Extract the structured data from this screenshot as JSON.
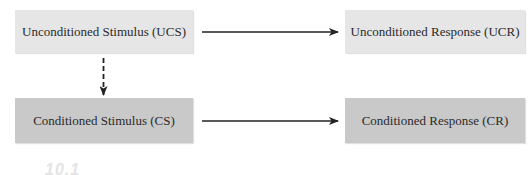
{
  "diagram": {
    "nodes": {
      "ucs": {
        "label": "Unconditioned Stimulus (UCS)",
        "fill": "#e6e6e6"
      },
      "ucr": {
        "label": "Unconditioned Response (UCR)",
        "fill": "#e6e6e6"
      },
      "cs": {
        "label": "Conditioned Stimulus (CS)",
        "fill": "#c9c9c9"
      },
      "cr": {
        "label": "Conditioned Response (CR)",
        "fill": "#c9c9c9"
      }
    },
    "edges": [
      {
        "from": "ucs",
        "to": "ucr",
        "style": "solid"
      },
      {
        "from": "ucs",
        "to": "cs",
        "style": "dashed"
      },
      {
        "from": "cs",
        "to": "cr",
        "style": "solid"
      }
    ],
    "caption_fragment": "10.1",
    "colors": {
      "arrow": "#222222",
      "text": "#2a2a2a",
      "caption": "#e4e4e4"
    }
  }
}
